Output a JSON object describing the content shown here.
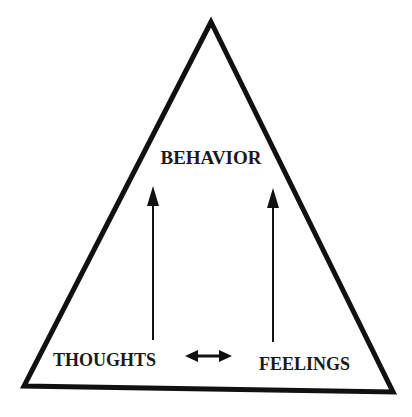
{
  "diagram": {
    "type": "triangle",
    "labels": {
      "top": "BEHAVIOR",
      "bottom_left": "THOUGHTS",
      "bottom_right": "FEELINGS"
    },
    "relations": [
      {
        "from": "THOUGHTS",
        "to": "BEHAVIOR",
        "type": "arrow-up"
      },
      {
        "from": "FEELINGS",
        "to": "BEHAVIOR",
        "type": "arrow-up"
      },
      {
        "from": "THOUGHTS",
        "to": "FEELINGS",
        "type": "double-arrow"
      }
    ],
    "colors": {
      "stroke": "#111111",
      "background": "#ffffff"
    }
  }
}
